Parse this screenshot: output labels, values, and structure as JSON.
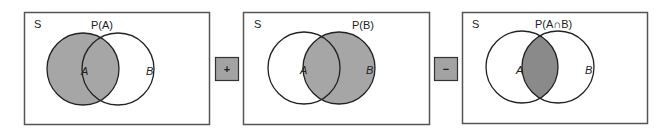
{
  "colors": {
    "shade": "#a6a6a6",
    "shade_dark": "#8a8a8a",
    "stroke": "#222222",
    "frame": "#555555",
    "operator_fill": "#a3a3a3"
  },
  "panels": [
    {
      "universe_label": "S",
      "title": "P(A)",
      "set_a_label": "A",
      "set_b_label": "B",
      "shaded": "A"
    },
    {
      "universe_label": "S",
      "title": "P(B)",
      "set_a_label": "A",
      "set_b_label": "B",
      "shaded": "B"
    },
    {
      "universe_label": "S",
      "title": "P(A∩B)",
      "set_a_label": "A",
      "set_b_label": "B",
      "shaded": "A∩B"
    }
  ],
  "operators": [
    {
      "symbol": "+"
    },
    {
      "symbol": "−"
    }
  ]
}
